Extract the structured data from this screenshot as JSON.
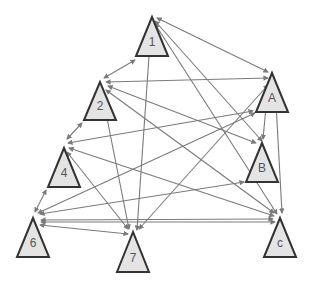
{
  "diagram": {
    "type": "directed-graph",
    "node_shape": "triangle",
    "colors": {
      "node_fill": "#e4e4e4",
      "node_stroke": "#333333",
      "edge": "#7a7a7a",
      "label": "#555555",
      "background": "#ffffff"
    },
    "nodes": [
      {
        "id": "1",
        "label": "1",
        "apex": [
          152,
          17
        ],
        "base_y": 56,
        "half_w": 16
      },
      {
        "id": "2",
        "label": "2",
        "apex": [
          100,
          82
        ],
        "base_y": 120,
        "half_w": 16
      },
      {
        "id": "A",
        "label": "A",
        "apex": [
          272,
          73
        ],
        "base_y": 112,
        "half_w": 16
      },
      {
        "id": "4",
        "label": "4",
        "apex": [
          64,
          148
        ],
        "base_y": 187,
        "half_w": 16
      },
      {
        "id": "B",
        "label": "B",
        "apex": [
          262,
          143
        ],
        "base_y": 182,
        "half_w": 16
      },
      {
        "id": "6",
        "label": "6",
        "apex": [
          33,
          218
        ],
        "base_y": 257,
        "half_w": 16
      },
      {
        "id": "7",
        "label": "7",
        "apex": [
          133,
          232
        ],
        "base_y": 272,
        "half_w": 16
      },
      {
        "id": "c",
        "label": "c",
        "apex": [
          280,
          218
        ],
        "base_y": 257,
        "half_w": 16
      }
    ],
    "edges": [
      {
        "from": "1",
        "to": "2",
        "p1": [
          135,
          60
        ],
        "p2": [
          104,
          78
        ]
      },
      {
        "from": "1",
        "to": "A",
        "p1": [
          157,
          18
        ],
        "p2": [
          268,
          72
        ]
      },
      {
        "from": "1",
        "to": "7",
        "p1": [
          151,
          27
        ],
        "p2": [
          137,
          230
        ]
      },
      {
        "from": "1",
        "to": "B",
        "p1": [
          155,
          21
        ],
        "p2": [
          262,
          141
        ]
      },
      {
        "from": "1",
        "to": "c",
        "p1": [
          155,
          24
        ],
        "p2": [
          277,
          214
        ]
      },
      {
        "from": "2",
        "to": "A",
        "p1": [
          106,
          82
        ],
        "p2": [
          268,
          78
        ]
      },
      {
        "from": "2",
        "to": "B",
        "p1": [
          108,
          86
        ],
        "p2": [
          256,
          143
        ]
      },
      {
        "from": "2",
        "to": "c",
        "p1": [
          106,
          90
        ],
        "p2": [
          274,
          213
        ]
      },
      {
        "from": "2",
        "to": "7",
        "p1": [
          102,
          93
        ],
        "p2": [
          129,
          229
        ]
      },
      {
        "from": "2",
        "to": "4",
        "p1": [
          82,
          123
        ],
        "p2": [
          67,
          139
        ]
      },
      {
        "from": "A",
        "to": "4",
        "p1": [
          253,
          111
        ],
        "p2": [
          68,
          143
        ]
      },
      {
        "from": "A",
        "to": "6",
        "p1": [
          255,
          113
        ],
        "p2": [
          38,
          213
        ]
      },
      {
        "from": "A",
        "to": "7",
        "p1": [
          268,
          85
        ],
        "p2": [
          139,
          229
        ]
      },
      {
        "from": "A",
        "to": "B",
        "p1": [
          268,
          86
        ],
        "p2": [
          263,
          139
        ]
      },
      {
        "from": "A",
        "to": "c",
        "p1": [
          275,
          85
        ],
        "p2": [
          282,
          213
        ]
      },
      {
        "from": "4",
        "to": "7",
        "p1": [
          67,
          152
        ],
        "p2": [
          128,
          229
        ]
      },
      {
        "from": "4",
        "to": "c",
        "p1": [
          69,
          148
        ],
        "p2": [
          274,
          216
        ]
      },
      {
        "from": "4",
        "to": "6",
        "p1": [
          46,
          190
        ],
        "p2": [
          35,
          212
        ]
      },
      {
        "from": "6",
        "to": "B",
        "p1": [
          40,
          214
        ],
        "p2": [
          244,
          182
        ]
      },
      {
        "from": "6",
        "to": "c",
        "p1": [
          41,
          220
        ],
        "p2": [
          273,
          219
        ]
      },
      {
        "from": "6",
        "to": "7",
        "p1": [
          40,
          225
        ],
        "p2": [
          128,
          234
        ]
      },
      {
        "from": "6",
        "to": "c",
        "p1": [
          41,
          222
        ],
        "p2": [
          275,
          222
        ]
      }
    ]
  }
}
